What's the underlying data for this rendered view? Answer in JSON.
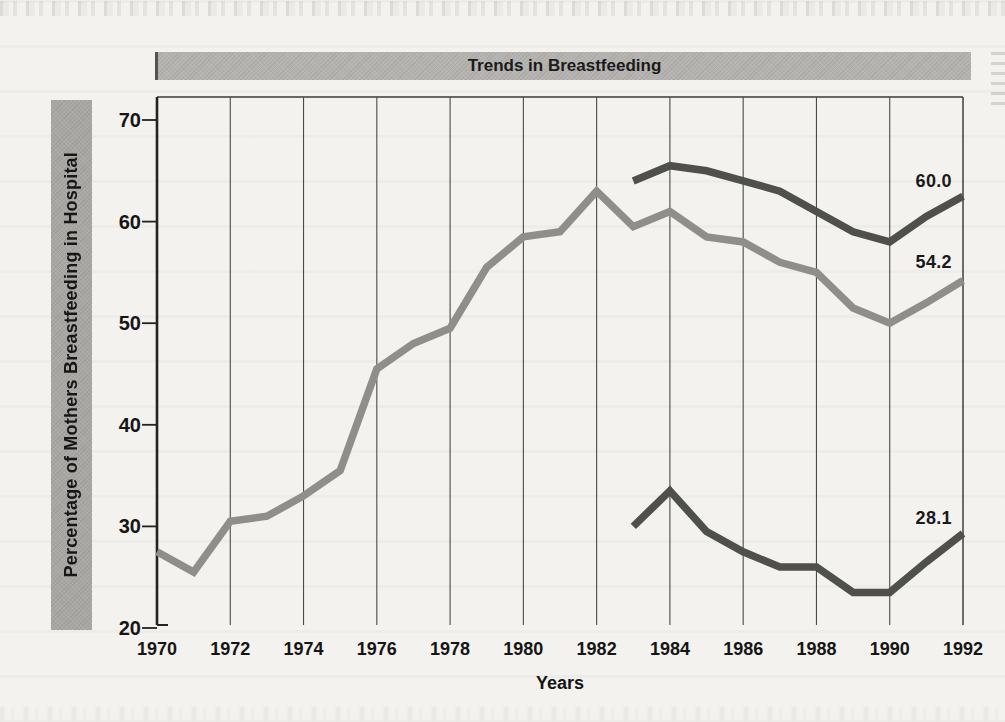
{
  "title_bar": {
    "text": "Trends in Breastfeeding",
    "bg": "#b5b3b0",
    "fg": "#1b1b1b"
  },
  "y_axis_bar": {
    "text": "Percentage of Mothers Breastfeeding in Hospital",
    "bg": "#a9a7a4",
    "fg": "#161616"
  },
  "chart_data": {
    "type": "line",
    "title": "Trends in Breastfeeding",
    "xlabel": "Years",
    "ylabel": "Percentage of Mothers Breastfeeding in Hospital",
    "xlim": [
      1970,
      1992
    ],
    "ylim": [
      20,
      70
    ],
    "x_ticks": [
      1970,
      1972,
      1974,
      1976,
      1978,
      1980,
      1982,
      1984,
      1986,
      1988,
      1990,
      1992
    ],
    "y_ticks": [
      70,
      60,
      50,
      40,
      30,
      20
    ],
    "grid": "vertical gridlines every 2 years, top frame, no bottom axis line",
    "legend": "none (numeric end-of-line labels only)",
    "colors": {
      "gray_line": "#8f8e8b",
      "dark_line": "#4f4f4c",
      "gridline": "#4a4a4a",
      "axis": "#222222",
      "background": "#f3f2ee"
    },
    "series": [
      {
        "name": "gray-line-1970-1992",
        "color": "#8f8e8b",
        "end_label": "54.2",
        "x": [
          1970,
          1971,
          1972,
          1973,
          1974,
          1975,
          1976,
          1977,
          1978,
          1979,
          1980,
          1981,
          1982,
          1983,
          1984,
          1985,
          1986,
          1987,
          1988,
          1989,
          1990,
          1991,
          1992
        ],
        "values": [
          27.5,
          25.5,
          30.5,
          31,
          33,
          35.5,
          45.5,
          48,
          49.5,
          55.5,
          58.5,
          59,
          63,
          59.5,
          61,
          58.5,
          58,
          56,
          55,
          51.5,
          50,
          52,
          54.2
        ]
      },
      {
        "name": "dark-upper-line-1983-1992",
        "color": "#4f4f4c",
        "end_label": "60.0",
        "x": [
          1983,
          1984,
          1985,
          1986,
          1987,
          1988,
          1989,
          1990,
          1991,
          1992
        ],
        "values": [
          64,
          65.5,
          65,
          64,
          63,
          61,
          59,
          58,
          60.5,
          62.5
        ]
      },
      {
        "name": "dark-lower-line-1983-1992",
        "color": "#4f4f4c",
        "end_label": "28.1",
        "x": [
          1983,
          1984,
          1985,
          1986,
          1987,
          1988,
          1989,
          1990,
          1991,
          1992
        ],
        "values": [
          30,
          33.5,
          29.5,
          27.5,
          26,
          26,
          23.5,
          23.5,
          26.5,
          29.3
        ]
      }
    ],
    "annotations": [
      {
        "text": "60.0",
        "x": 1991.2,
        "y": 64.0
      },
      {
        "text": "54.2",
        "x": 1991.2,
        "y": 56.0
      },
      {
        "text": "28.1",
        "x": 1991.2,
        "y": 30.8
      }
    ]
  }
}
